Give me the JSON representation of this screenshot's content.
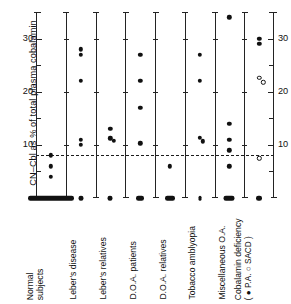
{
  "chart_data": {
    "type": "scatter",
    "title": "",
    "xlabel": "",
    "ylabel": "CN–Cbl as % of total plasma cobalamin",
    "ylim": [
      0,
      35
    ],
    "yticks_major": [
      10,
      20,
      30
    ],
    "yticks_minor": [
      5,
      15,
      25,
      35
    ],
    "ytick_labels": [
      "10",
      "20",
      "30"
    ],
    "grid": false,
    "legend_position": "x-axis-label",
    "annotations": [
      {
        "name": "upper-limit-of-normal",
        "type": "dashed-horizontal-line",
        "y": 8
      }
    ],
    "marker_legend": [
      {
        "symbol": "●",
        "label": "P.A."
      },
      {
        "symbol": "○",
        "label": "SACD"
      }
    ],
    "categories": [
      "Normal subjects",
      "Leber's disease",
      "Leber's relatives",
      "D.O.A. patients",
      "D.O.A. relatives",
      "Tobacco amblyopia",
      "Miscellaneous O.A.",
      "Cobalamin deficiency"
    ],
    "groups": [
      {
        "category": "Normal subjects",
        "label_lines": [
          "Normal",
          "subjects"
        ],
        "points_filled": [
          8.0,
          6.0,
          4.0
        ],
        "points_open": [],
        "baseline_band": {
          "y": 0,
          "spread": 46,
          "count": 30
        }
      },
      {
        "category": "Leber's disease",
        "label_lines": [
          "Leber's disease"
        ],
        "points_filled": [
          28.0,
          27.0,
          22.0,
          11.0,
          10.0
        ],
        "points_open": [],
        "baseline_band": {
          "y": 0,
          "spread": 5,
          "count": 6
        }
      },
      {
        "category": "Leber's relatives",
        "label_lines": [
          "Leber's relatives"
        ],
        "points_filled": [
          13.0,
          11.2,
          10.8
        ],
        "points_open": [],
        "baseline_band": {
          "y": 0,
          "spread": 5,
          "count": 5
        }
      },
      {
        "category": "D.O.A. patients",
        "label_lines": [
          "D.O.A. patients"
        ],
        "points_filled": [
          27.0,
          22.0,
          17.0,
          10.3
        ],
        "points_open": [],
        "baseline_band": {
          "y": 0,
          "spread": 8,
          "count": 7
        }
      },
      {
        "category": "D.O.A. relatives",
        "label_lines": [
          "D.O.A. relatives"
        ],
        "points_filled": [
          6.0
        ],
        "points_open": [],
        "baseline_band": {
          "y": 0,
          "spread": 10,
          "count": 6
        }
      },
      {
        "category": "Tobacco amblyopia",
        "label_lines": [
          "Tobacco amblyopia"
        ],
        "points_filled": [
          27.0,
          22.0,
          11.3,
          10.7
        ],
        "points_open": [],
        "baseline_band": {
          "y": 0,
          "spread": 3,
          "count": 1
        }
      },
      {
        "category": "Miscellaneous O.A.",
        "label_lines": [
          "Miscellaneous O.A."
        ],
        "points_filled": [
          34.0,
          14.0,
          11.0,
          9.0,
          6.0
        ],
        "points_open": [],
        "baseline_band": {
          "y": 0,
          "spread": 11,
          "count": 8
        }
      },
      {
        "category": "Cobalamin deficiency",
        "label_lines": [
          "Cobalamin deficiency",
          "( ● P.A.  ○ SACD )"
        ],
        "points_filled": [
          30.0,
          29.0
        ],
        "points_open": [
          22.6,
          21.8,
          7.5
        ],
        "baseline_band": {
          "y": 0,
          "spread": 6,
          "count": 4
        }
      }
    ]
  },
  "axis": {
    "y_label": "CN–Cbl as % of total plasma cobalamin",
    "left_tick_labels": [
      "30",
      "20",
      "10"
    ],
    "right_tick_labels": [
      "30",
      "20",
      "10"
    ]
  }
}
